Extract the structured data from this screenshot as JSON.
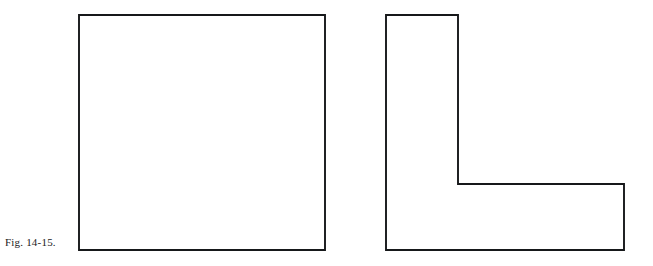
{
  "figure": {
    "caption": "Fig. 14-15.",
    "background_color": "#ffffff",
    "stroke_color": "#16181a",
    "fill_color": "#ffffff",
    "stroke_width": 1.9,
    "canvas": {
      "width": 653,
      "height": 266
    }
  },
  "shapes": [
    {
      "id": "square",
      "name": "square-shape",
      "kind": "rectangle",
      "label": "Square",
      "points": "79,15 325,15 325,250 79,250",
      "bounds": {
        "x": 79,
        "y": 15,
        "width": 246,
        "height": 235
      }
    },
    {
      "id": "l-shape",
      "name": "l-shape",
      "kind": "polygon",
      "label": "L-shape",
      "points": "386,15 458,15 458,184 624,184 624,250 386,250",
      "bounds": {
        "x": 386,
        "y": 15,
        "width": 238,
        "height": 235
      }
    }
  ]
}
